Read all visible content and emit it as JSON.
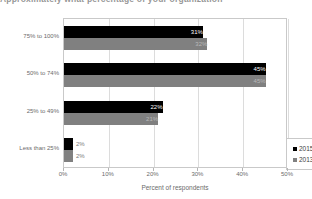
{
  "title_strip": {
    "text": "Approximately what percentage of your organization"
  },
  "chart_data": {
    "type": "bar",
    "orientation": "horizontal",
    "title": "",
    "xlabel": "Percent of respondents",
    "ylabel": "",
    "xlim": [
      0,
      50
    ],
    "xticks": [
      "0%",
      "10%",
      "20%",
      "30%",
      "40%",
      "50%"
    ],
    "xtick_values": [
      0,
      10,
      20,
      30,
      40,
      50
    ],
    "grid": true,
    "legend_position": "lower-right-inside",
    "categories": [
      "75% to 100%",
      "50% to 74%",
      "25% to 49%",
      "Less than 25%"
    ],
    "series": [
      {
        "name": "2015",
        "color": "#000000",
        "values": [
          31,
          45,
          22,
          2
        ],
        "labels": [
          "31%",
          "45%",
          "22%",
          "2%"
        ]
      },
      {
        "name": "2013",
        "color": "#808080",
        "values": [
          32,
          45,
          21,
          2
        ],
        "labels": [
          "32%",
          "45%",
          "21%",
          "2%"
        ]
      }
    ]
  },
  "legend": {
    "entries": [
      {
        "label": "2015",
        "color": "#000000"
      },
      {
        "label": "2013",
        "color": "#808080"
      }
    ]
  },
  "colors": {
    "series_2015": "#000000",
    "series_2013": "#808080",
    "axis": "#c9c9c9",
    "grid": "#dcdcdc",
    "text": "#6b6b6b"
  }
}
